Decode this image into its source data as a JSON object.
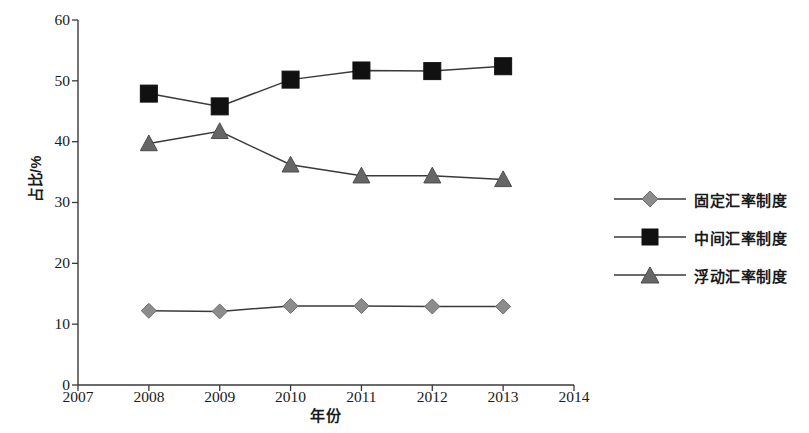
{
  "chart_data": {
    "type": "line",
    "title": "",
    "xlabel": "年份",
    "ylabel": "占比/%",
    "x": [
      2008,
      2009,
      2010,
      2011,
      2012,
      2013
    ],
    "xlim": [
      2007,
      2014
    ],
    "ylim": [
      0,
      60
    ],
    "xticks": [
      "2007",
      "2008",
      "2009",
      "2010",
      "2011",
      "2012",
      "2013",
      "2014"
    ],
    "yticks": [
      "0",
      "10",
      "20",
      "30",
      "40",
      "50",
      "60"
    ],
    "grid": false,
    "legend_position": "right",
    "series": [
      {
        "name": "固定汇率制度",
        "marker": "diamond",
        "color": "#8c8c8c",
        "line_color": "#3a3a3a",
        "values": [
          12.2,
          12.1,
          13.0,
          13.0,
          12.9,
          12.9
        ]
      },
      {
        "name": "中间汇率制度",
        "marker": "square",
        "color": "#111111",
        "line_color": "#3a3a3a",
        "values": [
          47.9,
          45.8,
          50.2,
          51.7,
          51.6,
          52.4
        ]
      },
      {
        "name": "浮动汇率制度",
        "marker": "triangle",
        "color": "#666666",
        "line_color": "#3a3a3a",
        "values": [
          39.7,
          41.7,
          36.2,
          34.4,
          34.4,
          33.8
        ]
      }
    ]
  },
  "axes": {
    "y_title": "占比/%",
    "x_title": "年份",
    "y_tick_labels": [
      "60",
      "50",
      "40",
      "30",
      "20",
      "10",
      "0"
    ],
    "x_tick_labels": [
      "2007",
      "2008",
      "2009",
      "2010",
      "2011",
      "2012",
      "2013",
      "2014"
    ]
  },
  "legend": {
    "items": [
      {
        "label": "固定汇率制度",
        "marker": "diamond-marker"
      },
      {
        "label": "中间汇率制度",
        "marker": "square-marker"
      },
      {
        "label": "浮动汇率制度",
        "marker": "triangle-marker"
      }
    ]
  },
  "style": {
    "axis_color": "#3a3a3a",
    "background": "#ffffff",
    "text_color": "#1a1a1a"
  }
}
